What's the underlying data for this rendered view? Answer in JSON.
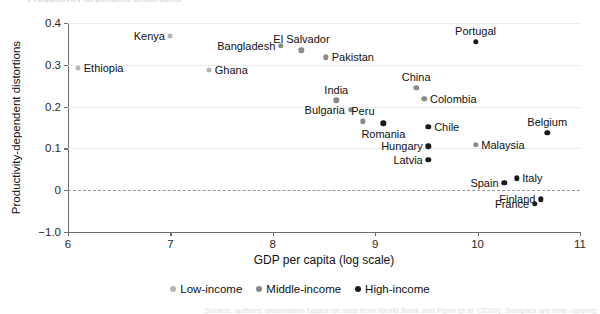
{
  "clipped_title": "Productivity-dependent distortions",
  "clipped_source": "Source: authors' elaboration based on data from World Bank and Penn et al. (2020). Samples are time-varying.",
  "legend": {
    "items": [
      {
        "label": "Low-income",
        "color": "#b5b5b5"
      },
      {
        "label": "Middle-income",
        "color": "#8a8a8a"
      },
      {
        "label": "High-income",
        "color": "#1a1a1a"
      }
    ]
  },
  "chart_data": {
    "type": "scatter",
    "title": "",
    "xlabel": "GDP per capita (log scale)",
    "ylabel": "Productivity-dependent distortions",
    "xlim": [
      6,
      11
    ],
    "ylim": [
      -0.1,
      0.4
    ],
    "xticks": [
      "6",
      "7",
      "8",
      "9",
      "10",
      "11"
    ],
    "xtick_values": [
      6,
      7,
      8,
      9,
      10,
      11
    ],
    "yticks": [
      "0.4",
      "0.3",
      "0.2",
      "0.1",
      "0",
      "-1.0"
    ],
    "ytick_values": [
      0.4,
      0.3,
      0.2,
      0.1,
      0,
      -0.1
    ],
    "grid": "horizontal",
    "zero_reference_line": 0,
    "legend_position": "bottom-center",
    "series": [
      {
        "name": "Low-income",
        "color": "#b5b5b5",
        "points": [
          {
            "label": "Ethiopia",
            "x": 6.1,
            "y": 0.293,
            "label_pos": "right"
          },
          {
            "label": "Kenya",
            "x": 7.0,
            "y": 0.37,
            "label_pos": "left"
          },
          {
            "label": "Ghana",
            "x": 7.38,
            "y": 0.288,
            "label_pos": "right"
          }
        ]
      },
      {
        "name": "Middle-income",
        "color": "#8a8a8a",
        "points": [
          {
            "label": "Bangladesh",
            "x": 8.08,
            "y": 0.345,
            "label_pos": "left"
          },
          {
            "label": "El Salvador",
            "x": 8.28,
            "y": 0.335,
            "label_pos": "above"
          },
          {
            "label": "Pakistan",
            "x": 8.52,
            "y": 0.318,
            "label_pos": "right"
          },
          {
            "label": "India",
            "x": 8.62,
            "y": 0.215,
            "label_pos": "above"
          },
          {
            "label": "Bulgaria",
            "x": 8.76,
            "y": 0.192,
            "label_pos": "left"
          },
          {
            "label": "Peru",
            "x": 8.88,
            "y": 0.165,
            "label_pos": "above"
          },
          {
            "label": "China",
            "x": 9.4,
            "y": 0.245,
            "label_pos": "above"
          },
          {
            "label": "Colombia",
            "x": 9.48,
            "y": 0.218,
            "label_pos": "right"
          },
          {
            "label": "Malaysia",
            "x": 9.98,
            "y": 0.108,
            "label_pos": "right"
          }
        ]
      },
      {
        "name": "High-income",
        "color": "#1a1a1a",
        "points": [
          {
            "label": "Romania",
            "x": 9.08,
            "y": 0.16,
            "label_pos": "below"
          },
          {
            "label": "Portugal",
            "x": 9.98,
            "y": 0.355,
            "label_pos": "above"
          },
          {
            "label": "Chile",
            "x": 9.52,
            "y": 0.152,
            "label_pos": "right"
          },
          {
            "label": "Hungary",
            "x": 9.52,
            "y": 0.105,
            "label_pos": "left"
          },
          {
            "label": "Latvia",
            "x": 9.52,
            "y": 0.072,
            "label_pos": "left"
          },
          {
            "label": "Belgium",
            "x": 10.68,
            "y": 0.138,
            "label_pos": "above"
          },
          {
            "label": "Spain",
            "x": 10.26,
            "y": 0.018,
            "label_pos": "left"
          },
          {
            "label": "Italy",
            "x": 10.38,
            "y": 0.028,
            "label_pos": "right"
          },
          {
            "label": "Finland",
            "x": 10.62,
            "y": -0.022,
            "label_pos": "left"
          },
          {
            "label": "France",
            "x": 10.56,
            "y": -0.032,
            "label_pos": "left"
          }
        ]
      }
    ]
  }
}
